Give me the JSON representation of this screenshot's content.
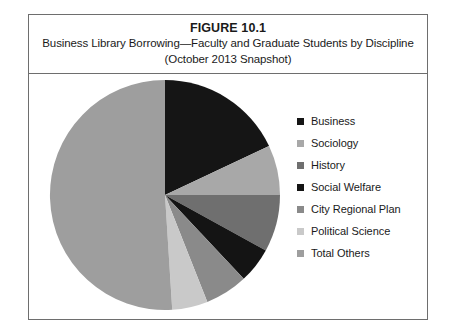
{
  "figure": {
    "number": "FIGURE 10.1",
    "caption_line_1": "Business Library Borrowing—Faculty and Graduate Students by Discipline",
    "caption_line_2": "(October 2013 Snapshot)"
  },
  "page_bleed": {
    "line_a": "........",
    "line_b": "........",
    "line_c": "........"
  },
  "chart_data": {
    "type": "pie",
    "title": "Business Library Borrowing—Faculty and Graduate Students by Discipline",
    "subtitle": "(October 2013 Snapshot)",
    "legend_position": "right",
    "start_angle": 0,
    "direction": "clockwise",
    "categories": [
      "Business",
      "Sociology",
      "History",
      "Social Welfare",
      "City Regional Plan",
      "Political Science",
      "Total Others"
    ],
    "values": [
      18,
      7,
      8,
      5,
      6,
      5,
      51
    ],
    "colors": [
      "#151515",
      "#a8a8a8",
      "#6f6f6f",
      "#141414",
      "#8a8a8a",
      "#c9c9c9",
      "#9e9e9e"
    ],
    "slices": [
      {
        "label": "Business",
        "value": 18,
        "color": "#151515"
      },
      {
        "label": "Sociology",
        "value": 7,
        "color": "#a8a8a8"
      },
      {
        "label": "History",
        "value": 8,
        "color": "#6f6f6f"
      },
      {
        "label": "Social Welfare",
        "value": 5,
        "color": "#141414"
      },
      {
        "label": "City Regional Plan",
        "value": 6,
        "color": "#8a8a8a"
      },
      {
        "label": "Political Science",
        "value": 5,
        "color": "#c9c9c9"
      },
      {
        "label": "Total Others",
        "value": 51,
        "color": "#9e9e9e"
      }
    ]
  }
}
